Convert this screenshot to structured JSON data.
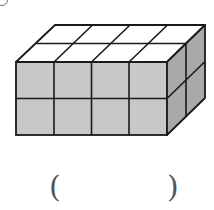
{
  "figure": {
    "dimensions": {
      "length": 4,
      "width": 2,
      "height": 2
    },
    "colors": {
      "front": "#c8c8c8",
      "side": "#a9a9a9",
      "top": "#ffffff",
      "stroke": "#1a1a1a"
    }
  },
  "answer": {
    "open_paren": "(",
    "close_paren": ")",
    "value": ""
  }
}
